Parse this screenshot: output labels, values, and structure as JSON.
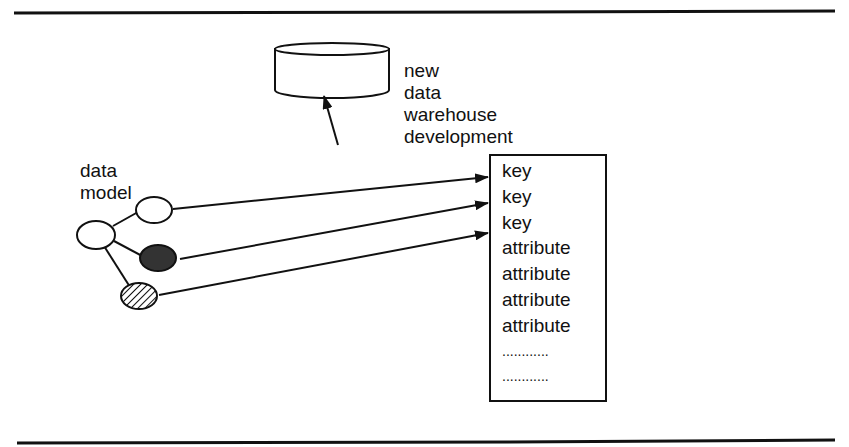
{
  "diagram": {
    "data_model_label": [
      "data",
      "model"
    ],
    "warehouse_label": [
      "new",
      "data",
      "warehouse",
      "development"
    ],
    "record_fields": [
      "key",
      "key",
      "key",
      "attribute",
      "attribute",
      "attribute",
      "attribute",
      "............",
      "............"
    ],
    "entity_fills": {
      "root": "#ffffff",
      "child_1": "#ffffff",
      "child_2": "#333333",
      "child_3": "hatched"
    }
  }
}
